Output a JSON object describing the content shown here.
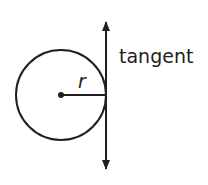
{
  "diagram": {
    "labels": {
      "tangent": "tangent",
      "radius": "r"
    },
    "circle": {
      "cx": 61,
      "cy": 95,
      "r": 45
    },
    "tangent_line": {
      "x": 106,
      "y1": 15,
      "y2": 176
    },
    "colors": {
      "stroke": "#231f20",
      "background": "#ffffff"
    }
  }
}
